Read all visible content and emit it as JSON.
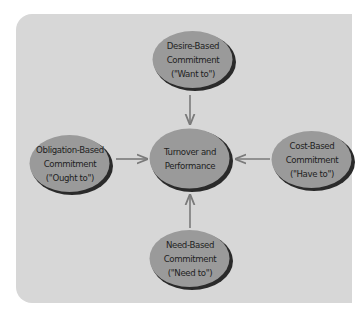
{
  "diagram": {
    "type": "hub-and-spoke",
    "colors": {
      "panel_background": "#d7d7d7",
      "ellipse_fill": "#9a9a9a",
      "ellipse_shadow": "#2a2a2a",
      "arrow": "#7a7a7a",
      "text": "#1e1e1e"
    },
    "center": {
      "id": "turnover-performance",
      "lines": [
        "Turnover and",
        "Performance"
      ]
    },
    "nodes": {
      "top": {
        "id": "desire-based",
        "lines": [
          "Desire-Based",
          "Commitment",
          "(\"Want to\")"
        ]
      },
      "left": {
        "id": "obligation-based",
        "lines": [
          "Obligation-Based",
          "Commitment",
          "(\"Ought to\")"
        ]
      },
      "right": {
        "id": "cost-based",
        "lines": [
          "Cost-Based",
          "Commitment",
          "(\"Have to\")"
        ]
      },
      "bottom": {
        "id": "need-based",
        "lines": [
          "Need-Based",
          "Commitment",
          "(\"Need to\")"
        ]
      }
    },
    "edges": [
      {
        "from": "desire-based",
        "to": "turnover-performance"
      },
      {
        "from": "obligation-based",
        "to": "turnover-performance"
      },
      {
        "from": "cost-based",
        "to": "turnover-performance"
      },
      {
        "from": "need-based",
        "to": "turnover-performance"
      }
    ]
  }
}
